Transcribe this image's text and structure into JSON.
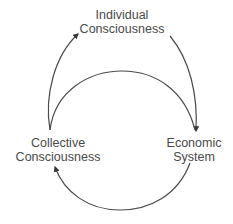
{
  "diagram": {
    "type": "cycle",
    "nodes": [
      {
        "id": "individual",
        "lines": [
          "Individual",
          "Consciousness"
        ]
      },
      {
        "id": "economic",
        "lines": [
          "Economic",
          "System"
        ]
      },
      {
        "id": "collective",
        "lines": [
          "Collective",
          "Consciousness"
        ]
      }
    ],
    "edges": [
      {
        "from": "individual",
        "to": "economic"
      },
      {
        "from": "collective",
        "to": "individual"
      },
      {
        "from": "collective",
        "to": "economic",
        "arrow": "none"
      },
      {
        "from": "economic",
        "to": "collective"
      }
    ],
    "colors": {
      "stroke": "#4a4a4a",
      "text": "#4a4a4a",
      "background": "#ffffff"
    }
  }
}
